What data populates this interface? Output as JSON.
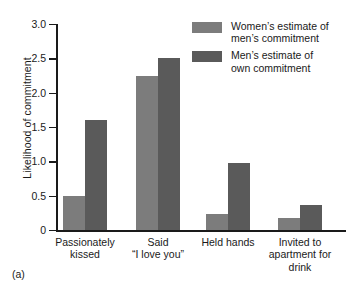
{
  "caption": "(a)",
  "chart_data": {
    "type": "bar",
    "title": "",
    "xlabel": "",
    "ylabel": "Likelihood of commitment",
    "ylim": [
      0,
      3.0
    ],
    "yticks": [
      "0",
      "0.5",
      "1.0",
      "1.5",
      "2.0",
      "2.5",
      "3.0"
    ],
    "ytick_values": [
      0,
      0.5,
      1.0,
      1.5,
      2.0,
      2.5,
      3.0
    ],
    "grid": false,
    "legend_position": "top-right",
    "categories": [
      "Passionately\nkissed",
      "Said\n“I love you”",
      "Held hands",
      "Invited to\napartment for\ndrink"
    ],
    "series": [
      {
        "name": "Women’s estimate of\nmen’s commitment",
        "color": "#7c7c7c",
        "values": [
          0.49,
          2.25,
          0.24,
          0.18
        ]
      },
      {
        "name": "Men’s estimate of\nown commitment",
        "color": "#5a5a5a",
        "values": [
          1.6,
          2.5,
          0.97,
          0.37
        ]
      }
    ]
  }
}
